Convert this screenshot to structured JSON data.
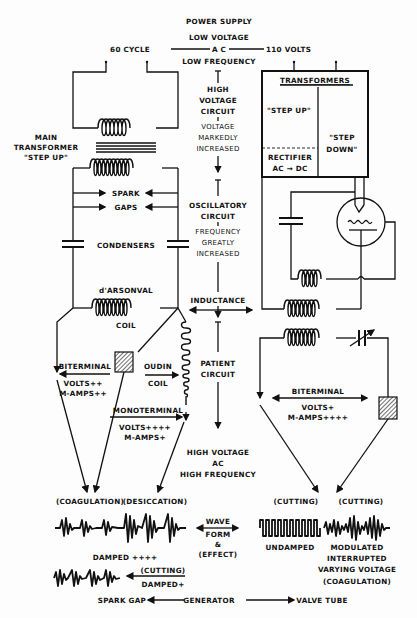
{
  "power_supply": {
    "title": "POWER SUPPLY",
    "low_voltage": "LOW VOLTAGE",
    "cycle": "60 CYCLE",
    "ac": "A C",
    "volts": "110 VOLTS",
    "low_frequency": "LOW FREQUENCY"
  },
  "center_column": {
    "high": "HIGH",
    "voltage": "VOLTAGE",
    "circuit": "CIRCUIT",
    "voltage2": "VOLTAGE",
    "markedly": "MARKEDLY",
    "increased": "INCREASED",
    "oscillatory": "OSCILLATORY",
    "circuit2": "CIRCUIT",
    "frequency": "FREQUENCY",
    "greatly": "GREATLY",
    "increased2": "INCREASED",
    "inductance": "INDUCTANCE",
    "patient": "PATIENT",
    "circuit3": "CIRCUIT",
    "hv": "HIGH VOLTAGE",
    "hv_ac": "AC",
    "hv_hf": "HIGH FREQUENCY"
  },
  "left_circuit": {
    "main": "MAIN",
    "transformer": "TRANSFORMER",
    "step_up": "\"STEP UP\"",
    "spark": "SPARK",
    "gaps": "GAPS",
    "condensers": "CONDENSERS",
    "darsonval": "d'ARSONVAL",
    "coil": "COIL",
    "biterminal": "BITERMINAL",
    "volts_pp": "VOLTS++",
    "mamps_pp": "M-AMPS++",
    "oudin": "OUDIN",
    "oudin_coil": "COIL",
    "monoterminal": "MONOTERMINAL",
    "volts_pppp": "VOLTS++++",
    "mamps_p": "M-AMPS+"
  },
  "right_circuit": {
    "transformers": "TRANSFORMERS",
    "step_up": "\"STEP UP\"",
    "step": "\"STEP",
    "down": "DOWN\"",
    "rectifier": "RECTIFIER",
    "ac_dc": "AC → DC",
    "biterminal": "BITERMINAL",
    "volts_p": "VOLTS+",
    "mamps_pppp": "M-AMPS++++"
  },
  "waveforms": {
    "coagulation": "(COAGULATION)",
    "desiccation": "(DESICCATION)",
    "damped4": "DAMPED ++++",
    "cutting_left": "(CUTTING)",
    "damped1": "DAMPED+",
    "wave": "WAVE",
    "form": "FORM",
    "amp": "&",
    "effect": "(EFFECT)",
    "cutting_r1": "(CUTTING)",
    "cutting_r2": "(CUTTING)",
    "undamped": "UNDAMPED",
    "modulated": "MODULATED",
    "interrupted": "INTERRUPTED",
    "varying": "VARYING VOLTAGE",
    "coag2": "(COAGULATION)"
  },
  "footer": {
    "spark_gap": "SPARK GAP",
    "generator": "GENERATOR",
    "valve_tube": "VALVE TUBE"
  }
}
